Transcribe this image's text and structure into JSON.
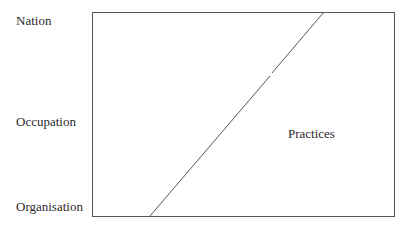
{
  "diagram": {
    "y_axis_labels": {
      "top": "Nation",
      "middle": "Occupation",
      "bottom": "Organisation"
    },
    "region_label": "Practices",
    "colors": {
      "line": "#555555",
      "text": "#2a2a2a",
      "background": "#ffffff"
    }
  }
}
